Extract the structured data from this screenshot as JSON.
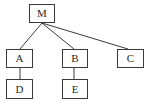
{
  "diagram": {
    "type": "tree",
    "colors": {
      "line": "#3a3a3a",
      "box_border": "#3a3a3a",
      "text": "#2a2a2a",
      "background": "#ffffff"
    },
    "nodes": {
      "M": {
        "label": "M"
      },
      "A": {
        "label": "A"
      },
      "B": {
        "label": "B"
      },
      "C": {
        "label": "C"
      },
      "D": {
        "label": "D"
      },
      "E": {
        "label": "E"
      }
    },
    "edges": [
      {
        "from": "M",
        "to": "A"
      },
      {
        "from": "M",
        "to": "B"
      },
      {
        "from": "M",
        "to": "C"
      },
      {
        "from": "A",
        "to": "D"
      },
      {
        "from": "B",
        "to": "E"
      }
    ]
  }
}
